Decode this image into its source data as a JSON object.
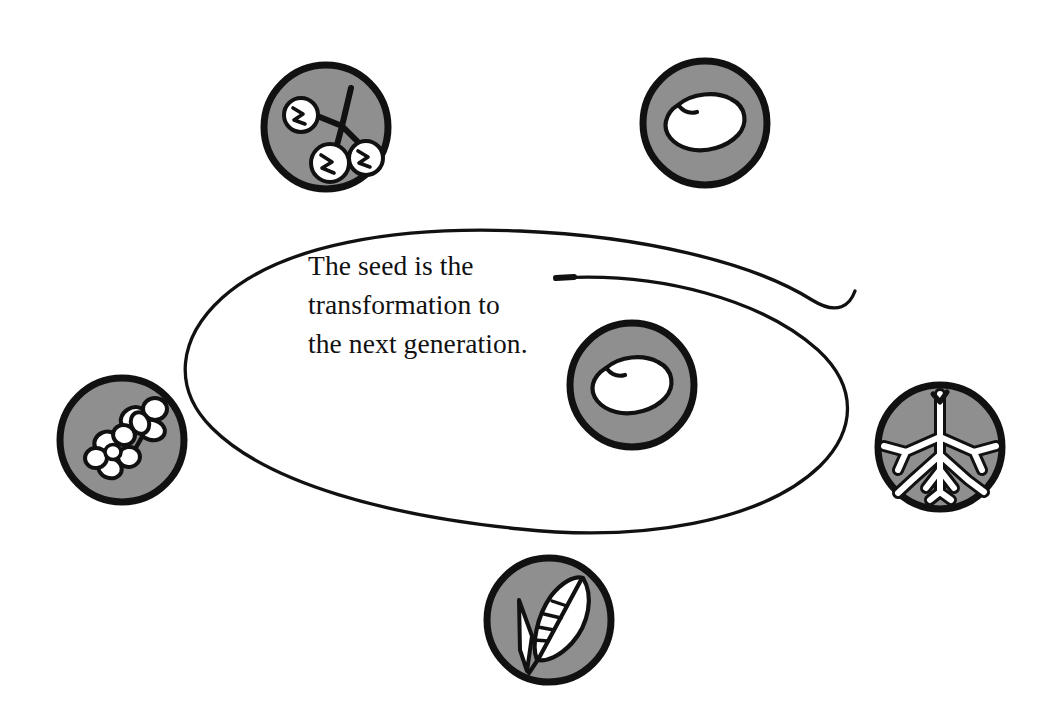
{
  "figure": {
    "caption": "The seed is the\ntransformation to\nthe next generation.",
    "caption_line_1": "The seed is the",
    "caption_line_2": "transformation to",
    "caption_line_3": "the next generation.",
    "background_color": "#ffffff",
    "ink_color": "#111111",
    "badge_fill_color": "#8f8f8f",
    "badge_stroke_color": "#111111",
    "icon_fill_color": "#ffffff",
    "loop": {
      "name": "life-cycle-spiral",
      "stroke_color": "#111111",
      "stroke_width": 3.2,
      "center_x": 521,
      "center_y": 376,
      "radius_x": 330,
      "radius_y": 150
    },
    "badges": [
      {
        "id": "fruits",
        "icon_name": "fruits-on-stem-icon",
        "label": "Fruits",
        "cx": 326,
        "cy": 127,
        "r": 65
      },
      {
        "id": "seed-top",
        "icon_name": "bean-seed-icon",
        "label": "Seed",
        "cx": 705,
        "cy": 123,
        "r": 65
      },
      {
        "id": "flowers",
        "icon_name": "flowers-icon",
        "label": "Flowers",
        "cx": 122,
        "cy": 440,
        "r": 65
      },
      {
        "id": "seed-center",
        "icon_name": "bean-seed-icon",
        "label": "Seed",
        "cx": 632,
        "cy": 385,
        "r": 65
      },
      {
        "id": "roots",
        "icon_name": "roots-icon",
        "label": "Roots",
        "cx": 940,
        "cy": 447,
        "r": 65
      },
      {
        "id": "leaf",
        "icon_name": "leaf-icon",
        "label": "Leaf",
        "cx": 549,
        "cy": 620,
        "r": 65
      }
    ]
  }
}
